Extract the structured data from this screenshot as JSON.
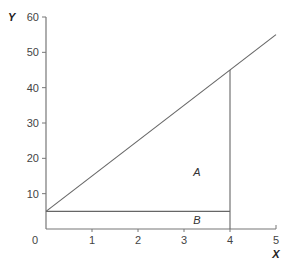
{
  "chart_data": {
    "type": "line",
    "title": "",
    "xlabel": "X",
    "ylabel": "Y",
    "xlim": [
      0,
      5
    ],
    "ylim": [
      0,
      60
    ],
    "x_ticks": [
      "0",
      "1",
      "2",
      "3",
      "4",
      "5"
    ],
    "y_ticks": [
      "10",
      "20",
      "30",
      "40",
      "50",
      "60"
    ],
    "grid": false,
    "series": [
      {
        "name": "line",
        "x": [
          0,
          5
        ],
        "y": [
          5,
          55
        ]
      },
      {
        "name": "horizontal-segment",
        "x": [
          0,
          4
        ],
        "y": [
          5,
          5
        ]
      },
      {
        "name": "vertical-segment",
        "x": [
          4,
          4
        ],
        "y": [
          0,
          45
        ]
      }
    ],
    "annotations": [
      {
        "text": "A",
        "x": 2.3,
        "y": 16,
        "description": "triangle region between line, y=5 and x=4"
      },
      {
        "text": "B",
        "x": 2.3,
        "y": 2.5,
        "description": "rectangle region between y=0, y=5 and x=4"
      }
    ]
  }
}
